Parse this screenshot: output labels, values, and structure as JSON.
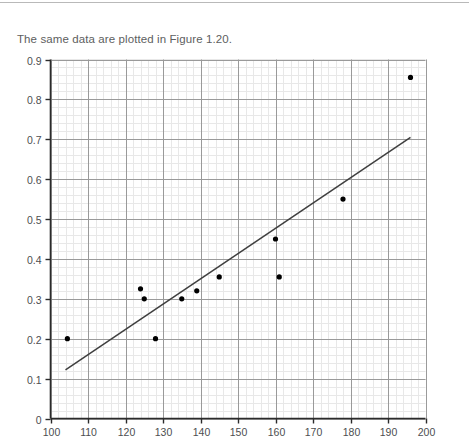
{
  "page": {
    "caption": "The same data are plotted in Figure 1.20."
  },
  "chart_data": {
    "type": "scatter",
    "title": "",
    "xlabel": "",
    "ylabel": "",
    "xlim": [
      100,
      200
    ],
    "ylim": [
      0,
      0.9
    ],
    "grid": true,
    "legend": "none",
    "x_ticks": [
      100,
      110,
      120,
      130,
      140,
      150,
      160,
      170,
      180,
      190,
      200
    ],
    "x_tick_labels": [
      "100",
      "110",
      "120",
      "130",
      "140",
      "150",
      "160",
      "170",
      "180",
      "190",
      "200"
    ],
    "y_ticks": [
      0,
      0.1,
      0.2,
      0.3,
      0.4,
      0.5,
      0.6,
      0.7,
      0.8,
      0.9
    ],
    "y_tick_labels": [
      "0",
      "0.1",
      "0.2",
      "0.3",
      "0.4",
      "0.5",
      "0.6",
      "0.7",
      "0.8",
      "0.9"
    ],
    "series": [
      {
        "name": "observations",
        "marker": "filled-circle",
        "color": "#000000",
        "points": [
          {
            "x": 104.5,
            "y": 0.2
          },
          {
            "x": 124.0,
            "y": 0.325
          },
          {
            "x": 125.0,
            "y": 0.3
          },
          {
            "x": 128.0,
            "y": 0.2
          },
          {
            "x": 135.0,
            "y": 0.3
          },
          {
            "x": 139.0,
            "y": 0.32
          },
          {
            "x": 145.0,
            "y": 0.355
          },
          {
            "x": 160.0,
            "y": 0.45
          },
          {
            "x": 161.0,
            "y": 0.355
          },
          {
            "x": 178.0,
            "y": 0.55
          },
          {
            "x": 196.0,
            "y": 0.855
          }
        ]
      }
    ],
    "trendline": {
      "name": "fitted line",
      "color": "#3f3f3f",
      "x_start": 104.0,
      "y_start": 0.122,
      "x_end": 196.0,
      "y_end": 0.705
    }
  },
  "colors": {
    "axis": "#2b2b2b",
    "major_grid": "#9a9a9a",
    "minor_grid": "#e8e8e8",
    "point": "#000000",
    "trendline": "#3f3f3f",
    "text": "#5d5e60",
    "rule": "#b9b9b9"
  }
}
